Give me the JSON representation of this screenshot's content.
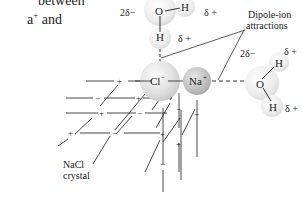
{
  "caption": {
    "line1": "between",
    "line2_prefix": "a",
    "line2_sup": "+",
    "line2_suffix": " and"
  },
  "labels": {
    "dipole_ion": [
      "Dipole-ion",
      "attractions"
    ],
    "nacl_crystal": [
      "NaCl",
      "crystal"
    ],
    "cl_ion": "Cl",
    "cl_charge": "−",
    "na_ion": "Na",
    "na_charge": "+",
    "top_water": {
      "O": "O",
      "H1": "H",
      "H2": "H",
      "partial_O": "2δ−",
      "partial_H1": "δ +",
      "partial_H2": "δ +"
    },
    "right_water": {
      "O": "O",
      "H1": "H",
      "H2": "H",
      "partial_O": "2δ−",
      "partial_H1": "δ +",
      "partial_H2": "δ +"
    }
  },
  "lattice_charges": {
    "plus": "+",
    "minus": "−"
  },
  "colors": {
    "line": "#333333",
    "text": "#222222",
    "sphere_light": "#f2f2f2",
    "sphere_mid": "#d6d6d6",
    "sphere_dark": "#b8b8b8"
  }
}
